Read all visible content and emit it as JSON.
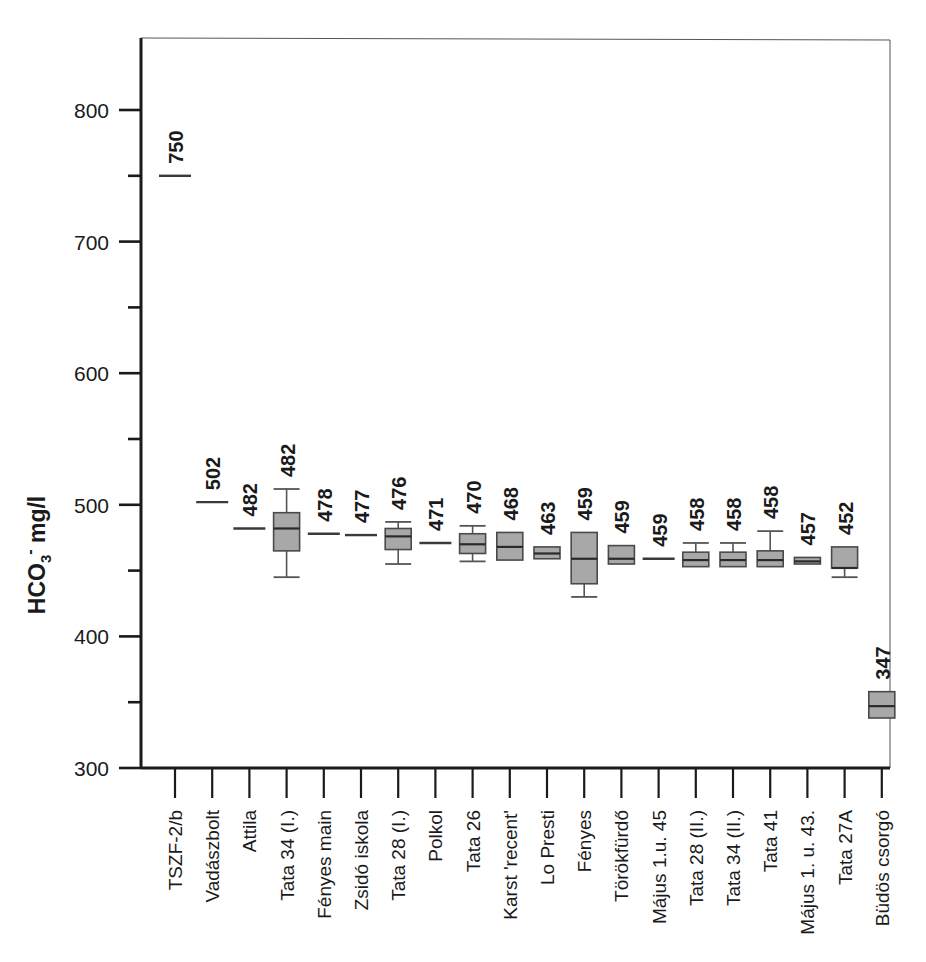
{
  "chart_data": {
    "type": "box",
    "title": "",
    "xlabel": "",
    "ylabel": "HCO3- mg/l",
    "ylabel_parts": {
      "base": "HCO",
      "subscript": "3",
      "superscript": "-",
      "unit": " mg/l"
    },
    "ylim": [
      300,
      840
    ],
    "ytick_labels": [
      "800",
      "700",
      "600",
      "500",
      "400",
      "300"
    ],
    "ytick_values": [
      800,
      700,
      600,
      500,
      400,
      300
    ],
    "yminor_values": [
      750,
      650,
      550,
      450,
      350
    ],
    "grid": false,
    "legend": null,
    "categories": [
      "TSZF-2/b",
      "Vadászbolt",
      "Attila",
      "Tata 34 (I.)",
      "Fényes main",
      "Zsidó iskola",
      "Tata 28 (I.)",
      "Polkol",
      "Tata 26",
      "Karst 'recent'",
      "Lo Presti",
      "Fényes",
      "Törökfürdő",
      "Május 1.u. 45",
      "Tata 28 (II.)",
      "Tata 34 (II.)",
      "Tata 41",
      "Május 1. u. 43.",
      "Tata 27A",
      "Büdös csorgó"
    ],
    "data_labels": [
      "750",
      "502",
      "482",
      "482",
      "478",
      "477",
      "476",
      "471",
      "470",
      "468",
      "463",
      "459",
      "459",
      "459",
      "458",
      "458",
      "458",
      "457",
      "452",
      "347"
    ],
    "boxes": [
      {
        "category": "TSZF-2/b",
        "label": "750",
        "median": 750,
        "kind": "line"
      },
      {
        "category": "Vadászbolt",
        "label": "502",
        "median": 502,
        "kind": "line"
      },
      {
        "category": "Attila",
        "label": "482",
        "median": 482,
        "kind": "line"
      },
      {
        "category": "Tata 34 (I.)",
        "label": "482",
        "median": 482,
        "q1": 465,
        "q3": 494,
        "whisker_low": 445,
        "whisker_high": 512,
        "kind": "box"
      },
      {
        "category": "Fényes main",
        "label": "478",
        "median": 478,
        "kind": "line"
      },
      {
        "category": "Zsidó iskola",
        "label": "477",
        "median": 477,
        "kind": "line"
      },
      {
        "category": "Tata 28 (I.)",
        "label": "476",
        "median": 476,
        "q1": 466,
        "q3": 482,
        "whisker_low": 455,
        "whisker_high": 487,
        "kind": "box"
      },
      {
        "category": "Polkol",
        "label": "471",
        "median": 471,
        "kind": "line"
      },
      {
        "category": "Tata 26",
        "label": "470",
        "median": 470,
        "q1": 463,
        "q3": 478,
        "whisker_low": 457,
        "whisker_high": 484,
        "kind": "box"
      },
      {
        "category": "Karst 'recent'",
        "label": "468",
        "median": 468,
        "q1": 458,
        "q3": 479,
        "kind": "box"
      },
      {
        "category": "Lo Presti",
        "label": "463",
        "median": 463,
        "q1": 459,
        "q3": 468,
        "kind": "box"
      },
      {
        "category": "Fényes",
        "label": "459",
        "median": 459,
        "q1": 440,
        "q3": 479,
        "whisker_low": 430,
        "kind": "box"
      },
      {
        "category": "Törökfürdő",
        "label": "459",
        "median": 459,
        "q1": 455,
        "q3": 469,
        "kind": "box"
      },
      {
        "category": "Május 1.u. 45",
        "label": "459",
        "median": 459,
        "kind": "line"
      },
      {
        "category": "Tata 28 (II.)",
        "label": "458",
        "median": 458,
        "q1": 453,
        "q3": 464,
        "whisker_high": 471,
        "kind": "box"
      },
      {
        "category": "Tata 34 (II.)",
        "label": "458",
        "median": 458,
        "q1": 453,
        "q3": 464,
        "whisker_high": 471,
        "kind": "box"
      },
      {
        "category": "Tata 41",
        "label": "458",
        "median": 458,
        "q1": 453,
        "q3": 465,
        "whisker_high": 480,
        "kind": "box"
      },
      {
        "category": "Május 1. u. 43.",
        "label": "457",
        "median": 457,
        "q1": 455,
        "q3": 460,
        "kind": "box"
      },
      {
        "category": "Tata 27A",
        "label": "452",
        "median": 452,
        "q1": 452,
        "q3": 468,
        "whisker_low": 445,
        "kind": "box"
      },
      {
        "category": "Büdös csorgó",
        "label": "347",
        "median": 347,
        "q1": 338,
        "q3": 358,
        "kind": "box"
      }
    ],
    "colors": {
      "box_fill": "#a8a8a8",
      "box_stroke": "#4a4a4a",
      "axis": "#1a1a1a",
      "background": "#ffffff"
    }
  }
}
